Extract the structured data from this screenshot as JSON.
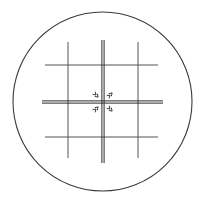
{
  "figure": {
    "kind": "optical-reticle-graticule",
    "canvas": {
      "width": 206,
      "height": 203
    },
    "background_color": "#ffffff"
  },
  "colors": {
    "circle_stroke": "#3a3a3a",
    "grid_stroke": "#555555",
    "crosshair_stroke": "#2b2b2b",
    "tick_stroke": "#333333",
    "background": "#ffffff"
  },
  "field_circle": {
    "name": "field-of-view-circle",
    "center_x": 102.5,
    "center_y": 101.5,
    "radius": 89.5,
    "stroke_width": 1.1,
    "fill": "none"
  },
  "crosshair": {
    "name": "center-crosshair",
    "center_x": 103,
    "center_y": 102,
    "style": "double-line",
    "line_gap": 2.2,
    "stroke_width": 1.0,
    "vertical": {
      "x": 103,
      "y1": 40,
      "y2": 163
    },
    "horizontal": {
      "y": 102,
      "x1": 42,
      "x2": 163
    }
  },
  "grid_lines": {
    "name": "reticle-grid",
    "stroke_width": 1.0,
    "vertical": [
      {
        "label": "v-left",
        "x": 68,
        "y1": 42,
        "y2": 158
      },
      {
        "label": "v-right",
        "x": 138,
        "y1": 42,
        "y2": 158
      }
    ],
    "horizontal": [
      {
        "label": "h-top",
        "y": 65,
        "x1": 45,
        "x2": 158
      },
      {
        "label": "h-bottom",
        "y": 137,
        "x1": 45,
        "x2": 158
      }
    ]
  },
  "quadrant_ticks": {
    "name": "quadrant-chevron-marks",
    "count": 4,
    "stroke_width": 0.9,
    "marks": [
      {
        "label": "tick-upper-left",
        "cx": 96,
        "cy": 95,
        "rotation": 45
      },
      {
        "label": "tick-upper-right",
        "cx": 110,
        "cy": 95,
        "rotation": -45
      },
      {
        "label": "tick-lower-left",
        "cx": 96,
        "cy": 109,
        "rotation": -45
      },
      {
        "label": "tick-lower-right",
        "cx": 110,
        "cy": 109,
        "rotation": 45
      }
    ]
  }
}
